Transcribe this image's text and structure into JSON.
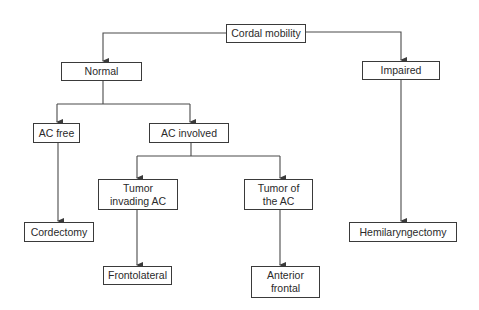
{
  "diagram": {
    "type": "flowchart",
    "colors": {
      "line": "#4a4a4a",
      "border": "#3a3a3a",
      "text": "#2a2a2a",
      "background": "#ffffff"
    },
    "nodes": [
      {
        "id": "cordal_mobility",
        "label": "Cordal mobility",
        "x": 226,
        "y": 24,
        "w": 80,
        "h": 19
      },
      {
        "id": "normal",
        "label": "Normal",
        "x": 61,
        "y": 62,
        "w": 81,
        "h": 19
      },
      {
        "id": "impaired",
        "label": "Impaired",
        "x": 362,
        "y": 61,
        "w": 78,
        "h": 19
      },
      {
        "id": "ac_free",
        "label": "AC free",
        "x": 33,
        "y": 123,
        "w": 47,
        "h": 20
      },
      {
        "id": "ac_involved",
        "label": "AC involved",
        "x": 149,
        "y": 123,
        "w": 80,
        "h": 20
      },
      {
        "id": "tumor_invading_ac",
        "label": "Tumor invading AC",
        "x": 98,
        "y": 179,
        "w": 80,
        "h": 31
      },
      {
        "id": "tumor_of_the_ac",
        "label": "Tumor of the AC",
        "x": 244,
        "y": 179,
        "w": 69,
        "h": 31
      },
      {
        "id": "cordectomy",
        "label": "Cordectomy",
        "x": 24,
        "y": 222,
        "w": 70,
        "h": 20
      },
      {
        "id": "frontolateral",
        "label": "Frontolateral",
        "x": 103,
        "y": 266,
        "w": 69,
        "h": 19
      },
      {
        "id": "anterior_frontal",
        "label": "Anterior frontal",
        "x": 251,
        "y": 266,
        "w": 69,
        "h": 32
      },
      {
        "id": "hemilaryngectomy",
        "label": "Hemilaryngectomy",
        "x": 349,
        "y": 222,
        "w": 108,
        "h": 20
      }
    ],
    "edges": [
      {
        "from": "cordal_mobility",
        "to": "normal"
      },
      {
        "from": "cordal_mobility",
        "to": "impaired"
      },
      {
        "from": "normal",
        "to": "ac_free"
      },
      {
        "from": "normal",
        "to": "ac_involved"
      },
      {
        "from": "ac_involved",
        "to": "tumor_invading_ac"
      },
      {
        "from": "ac_involved",
        "to": "tumor_of_the_ac"
      },
      {
        "from": "ac_free",
        "to": "cordectomy"
      },
      {
        "from": "tumor_invading_ac",
        "to": "frontolateral"
      },
      {
        "from": "tumor_of_the_ac",
        "to": "anterior_frontal"
      },
      {
        "from": "impaired",
        "to": "hemilaryngectomy"
      }
    ]
  }
}
